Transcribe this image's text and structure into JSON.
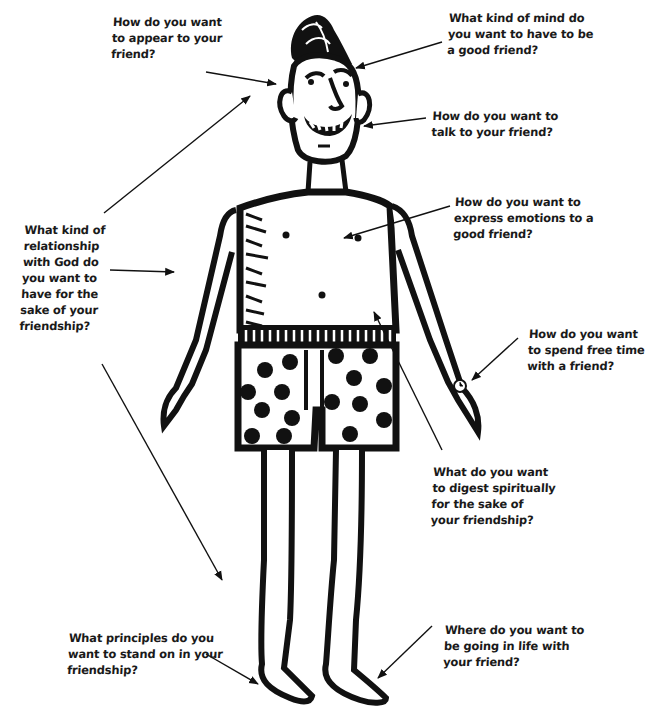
{
  "diagram": {
    "type": "annotated-figure",
    "colors": {
      "ink": "#111111",
      "text": "#1a1a1a",
      "background": "#ffffff"
    },
    "labels": [
      {
        "id": "appear",
        "target": "head/hair",
        "lines": [
          "How do you want",
          "to appear to your",
          "friend?"
        ]
      },
      {
        "id": "mind",
        "target": "head/top",
        "lines": [
          "What kind of mind do",
          "you want to have to be",
          "a good friend?"
        ]
      },
      {
        "id": "talk",
        "target": "mouth",
        "lines": [
          "How do you want to",
          "talk to your friend?"
        ]
      },
      {
        "id": "emotions",
        "target": "chest",
        "lines": [
          "How do you want to",
          "express emotions to a",
          "good friend?"
        ]
      },
      {
        "id": "god",
        "target": "shoulder/arm",
        "lines": [
          "What kind of",
          "relationship",
          "with God do",
          "you want to",
          "have for the",
          "sake of your",
          "friendship?"
        ]
      },
      {
        "id": "free-time",
        "target": "wristwatch",
        "lines": [
          "How do you want",
          "to spend free time",
          "with a friend?"
        ]
      },
      {
        "id": "digest",
        "target": "stomach",
        "lines": [
          "What do you want",
          "to digest spiritually",
          "for the sake of",
          "your friendship?"
        ]
      },
      {
        "id": "principles",
        "target": "left foot",
        "lines": [
          "What principles do you",
          "want to stand on in your",
          "friendship?"
        ]
      },
      {
        "id": "going",
        "target": "right foot",
        "lines": [
          "Where do you want to",
          "be going in life with",
          "your friend?"
        ]
      }
    ]
  }
}
